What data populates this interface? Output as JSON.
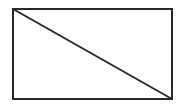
{
  "diagram": {
    "shape": "rectangle-with-diagonal",
    "stroke_color": "#2a2a2a",
    "rect": {
      "x": 13,
      "y": 9,
      "width": 159,
      "height": 90
    },
    "diagonal": {
      "x1": 13,
      "y1": 9,
      "x2": 172,
      "y2": 99
    }
  }
}
